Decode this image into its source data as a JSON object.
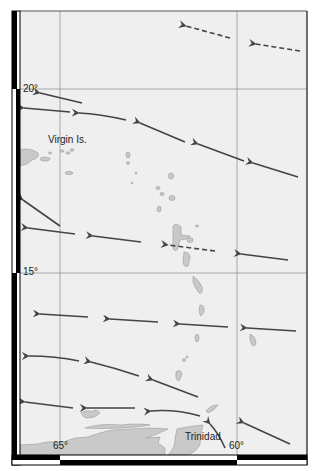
{
  "map": {
    "region": "Eastern Caribbean – Lesser Antilles",
    "colors": {
      "sea": "#efefef",
      "land": "#c9c9c9",
      "land_stroke": "#9a9a9a",
      "graticule": "#8a8a8a",
      "arrow": "#444444",
      "frame": "#000000"
    },
    "graticule": {
      "longitudes": [
        {
          "label": "65°",
          "x": 60
        },
        {
          "label": "60°",
          "x": 237
        }
      ],
      "latitudes": [
        {
          "label": "20°",
          "y": 89
        },
        {
          "label": "15°",
          "y": 273
        }
      ]
    },
    "place_labels": [
      {
        "name": "Virgin Is.",
        "x": 48,
        "y": 135
      },
      {
        "name": "Trinidad",
        "x": 185,
        "y": 432
      }
    ],
    "degree_labels": {
      "lat_20": "20°",
      "lat_15": "15°",
      "lon_65": "65°",
      "lon_60": "60°"
    },
    "arrows": [
      {
        "style": "dashed",
        "from": [
          230,
          38
        ],
        "to": [
          186,
          26
        ]
      },
      {
        "style": "dashed",
        "from": [
          300,
          51
        ],
        "to": [
          256,
          44
        ]
      },
      {
        "style": "solid",
        "from": [
          82,
          103
        ],
        "to": [
          40,
          93
        ]
      },
      {
        "style": "solid",
        "from": [
          70,
          112
        ],
        "to": [
          24,
          108
        ]
      },
      {
        "style": "solid",
        "from": [
          126,
          120
        ],
        "via": [
          100,
          114
        ],
        "to": [
          79,
          113
        ]
      },
      {
        "style": "solid",
        "from": [
          185,
          142
        ],
        "to": [
          140,
          123
        ]
      },
      {
        "style": "solid",
        "from": [
          244,
          161
        ],
        "to": [
          198,
          144
        ]
      },
      {
        "style": "solid",
        "from": [
          298,
          177
        ],
        "to": [
          253,
          163
        ]
      },
      {
        "style": "solid",
        "from": [
          60,
          226
        ],
        "via": [
          40,
          212
        ],
        "to": [
          23,
          200
        ]
      },
      {
        "style": "solid",
        "from": [
          75,
          234
        ],
        "to": [
          28,
          228
        ]
      },
      {
        "style": "solid",
        "from": [
          141,
          242
        ],
        "to": [
          93,
          236
        ]
      },
      {
        "style": "dashed",
        "from": [
          215,
          251
        ],
        "to": [
          168,
          245
        ]
      },
      {
        "style": "solid",
        "from": [
          288,
          260
        ],
        "to": [
          241,
          254
        ]
      },
      {
        "style": "solid",
        "from": [
          88,
          317
        ],
        "to": [
          40,
          314
        ]
      },
      {
        "style": "solid",
        "from": [
          158,
          322
        ],
        "to": [
          110,
          319
        ]
      },
      {
        "style": "solid",
        "from": [
          228,
          327
        ],
        "to": [
          180,
          324
        ]
      },
      {
        "style": "solid",
        "from": [
          296,
          331
        ],
        "to": [
          247,
          328
        ]
      },
      {
        "style": "solid",
        "from": [
          79,
          361
        ],
        "via": [
          55,
          356
        ],
        "to": [
          29,
          356
        ]
      },
      {
        "style": "solid",
        "from": [
          139,
          376
        ],
        "via": [
          115,
          368
        ],
        "to": [
          91,
          362
        ]
      },
      {
        "style": "solid",
        "from": [
          198,
          397
        ],
        "to": [
          153,
          380
        ]
      },
      {
        "style": "solid",
        "from": [
          73,
          408
        ],
        "to": [
          25,
          402
        ]
      },
      {
        "style": "solid",
        "from": [
          135,
          408
        ],
        "to": [
          87,
          408
        ]
      },
      {
        "style": "solid",
        "from": [
          200,
          416
        ],
        "via": [
          175,
          409
        ],
        "to": [
          151,
          411
        ]
      },
      {
        "style": "solid",
        "from": [
          225,
          448
        ],
        "via": [
          219,
          434
        ],
        "to": [
          210,
          424
        ]
      },
      {
        "style": "solid",
        "from": [
          290,
          444
        ],
        "to": [
          244,
          423
        ]
      }
    ]
  },
  "caption": "Figure: Easterly trade-wind flow across the Lesser Antilles"
}
